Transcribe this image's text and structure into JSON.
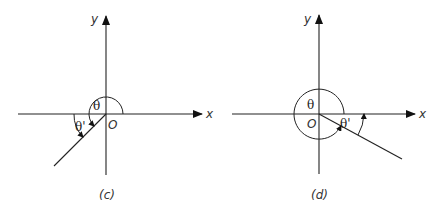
{
  "figure": {
    "panels": [
      {
        "id": "c",
        "caption": "(c)",
        "x_label": "x",
        "y_label": "y",
        "origin_label": "O",
        "theta_label": "θ",
        "theta_prime_label": "θ'",
        "terminal_side_quadrant": "III",
        "description": "Angle θ drawn from positive x-axis counterclockwise into quadrant III; reference angle θ' measured between terminal side and negative x-axis"
      },
      {
        "id": "d",
        "caption": "(d)",
        "x_label": "x",
        "y_label": "y",
        "origin_label": "O",
        "theta_label": "θ",
        "theta_prime_label": "θ'",
        "terminal_side_quadrant": "IV",
        "description": "Angle θ drawn almost full turn counterclockwise into quadrant IV; reference angle θ' measured between terminal side and positive x-axis"
      }
    ]
  }
}
